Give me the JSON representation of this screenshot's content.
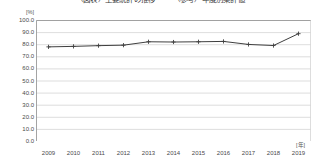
{
  "chart_data": {
    "type": "line",
    "title": "（図表）主要統計の推移　　　（参考）年度別集計値",
    "xlabel": "",
    "ylabel": "",
    "x_unit": "[年]",
    "y_unit": "[%]",
    "categories": [
      "2009",
      "2010",
      "2011",
      "2012",
      "2013",
      "2014",
      "2015",
      "2016",
      "2017",
      "2018",
      "2019"
    ],
    "values": [
      77.8,
      78.2,
      78.8,
      79.2,
      82.0,
      81.8,
      82.0,
      82.3,
      79.8,
      78.9,
      88.7
    ],
    "ylim": [
      0.0,
      100.0
    ],
    "ytick_labels": [
      "100.0",
      "90.0",
      "80.0",
      "70.0",
      "60.0",
      "50.0",
      "40.0",
      "30.0",
      "20.0",
      "10.0",
      "0.0"
    ],
    "ytick_values": [
      100.0,
      90.0,
      80.0,
      70.0,
      60.0,
      50.0,
      40.0,
      30.0,
      20.0,
      10.0,
      0.0
    ],
    "grid": true,
    "grid_axis": "y",
    "legend": false,
    "marker": "plus",
    "series_color": "#3f3f3f",
    "grid_color": "#d4d4d4",
    "axis_color": "#9a9a9a"
  }
}
